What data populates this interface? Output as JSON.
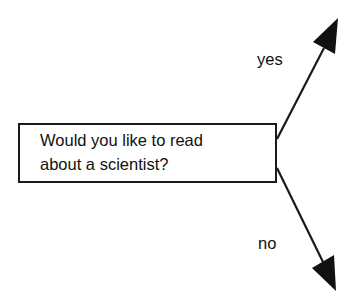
{
  "diagram": {
    "type": "decision-branch",
    "question": {
      "line1": "Would you like to read",
      "line2": "about a scientist?"
    },
    "branches": [
      {
        "label": "yes",
        "direction": "up-right"
      },
      {
        "label": "no",
        "direction": "down-right"
      }
    ],
    "colors": {
      "stroke": "#1a1a1a",
      "background": "#ffffff"
    }
  }
}
